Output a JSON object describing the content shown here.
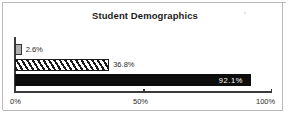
{
  "chart_data": {
    "type": "bar",
    "orientation": "horizontal",
    "title": "Student Demographics",
    "xlabel": "",
    "ylabel": "",
    "xlim": [
      0,
      100
    ],
    "grid": false,
    "legend": null,
    "tick_labels": [
      "0%",
      "50%",
      "100%"
    ],
    "ticks": [
      0,
      50,
      100
    ],
    "categories": [
      "series-1",
      "series-2",
      "series-3"
    ],
    "values": [
      2.6,
      36.8,
      92.1
    ],
    "data_labels": [
      "2.6%",
      "36.8%",
      "92.1%"
    ],
    "bar_styles": [
      "solid-gray",
      "diagonal-hatch",
      "solid-black"
    ],
    "colors": {
      "bar_gray": "#b0b0b0",
      "bar_hatch": "#1a1a1a",
      "bar_black": "#0d0d0d",
      "axis": "#3a3a3a",
      "text": "#2b2b2b",
      "inside_label": "#ffffff",
      "frame": "#b9b9b9"
    }
  }
}
